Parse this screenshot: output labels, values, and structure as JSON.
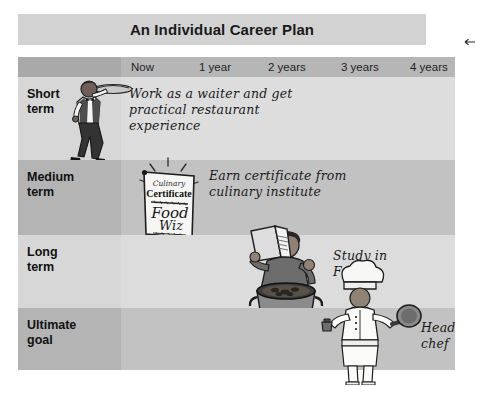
{
  "header": {
    "title": "An Individual Career Plan"
  },
  "edge_marker": {
    "icon": "left-arrow-marker"
  },
  "timeline": {
    "ticks": [
      {
        "label": "Now",
        "x": 10
      },
      {
        "label": "1 year",
        "x": 78
      },
      {
        "label": "2 years",
        "x": 147
      },
      {
        "label": "3 years",
        "x": 220
      },
      {
        "label": "4 years",
        "x": 289
      }
    ]
  },
  "rows": [
    {
      "label": "Short\nterm",
      "goal": "Work as a waiter and get\npractical restaurant\nexperience",
      "art": "waiter-carrying-tray"
    },
    {
      "label": "Medium\nterm",
      "goal": "Earn certificate from\nculinary institute",
      "art": "culinary-certificate"
    },
    {
      "label": "Long\nterm",
      "goal": "Study in\nFrance",
      "art": "cook-reading-book-at-pot"
    },
    {
      "label": "Ultimate\ngoal",
      "goal": "Head\nchef",
      "art": "head-chef-with-frying-pan"
    }
  ],
  "certificate": {
    "line1": "Culinary",
    "line2": "Certificate",
    "line3": "Food",
    "line4": "Wiz"
  },
  "colors": {
    "page_background": "#ffffff",
    "title_band": "#d2d2d2",
    "timeline_band": "#b6b6b6",
    "timeline_corner": "#a9a9a9",
    "row_light_label": "#d7d7d7",
    "row_light_content": "#dddddd",
    "row_dark_label": "#b4b4b4",
    "row_dark_content": "#c2c2c2",
    "text": "#1a1a1a"
  }
}
